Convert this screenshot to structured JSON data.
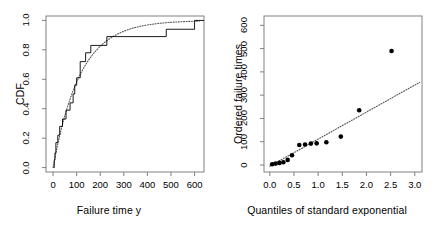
{
  "figure": {
    "background_color": "#ffffff",
    "foreground_color": "#000000",
    "panel_count": 2
  },
  "chart_data": [
    {
      "type": "line",
      "panel": "left",
      "title": "",
      "xlabel": "Failure time y",
      "ylabel": "CDF",
      "xlim": [
        -30,
        640
      ],
      "ylim": [
        -0.03,
        1.03
      ],
      "xticks": [
        0,
        100,
        200,
        300,
        400,
        500,
        600
      ],
      "xtick_labels": [
        "0",
        "100",
        "200",
        "300",
        "400",
        "500",
        "600"
      ],
      "yticks": [
        0.0,
        0.2,
        0.4,
        0.6,
        0.8,
        1.0
      ],
      "ytick_labels": [
        "0.0",
        "0.2",
        "0.4",
        "0.6",
        "0.8",
        "1.0"
      ],
      "grid": false,
      "legend": "none",
      "series": [
        {
          "name": "Empirical CDF",
          "style": "step",
          "line_style": "solid",
          "color": "#000000",
          "x": [
            2,
            5,
            8,
            12,
            20,
            28,
            40,
            55,
            72,
            85,
            92,
            100,
            115,
            138,
            160,
            228,
            480,
            600
          ],
          "y": [
            0.0,
            0.05,
            0.1,
            0.17,
            0.22,
            0.28,
            0.33,
            0.39,
            0.44,
            0.5,
            0.56,
            0.61,
            0.72,
            0.78,
            0.83,
            0.89,
            0.94,
            1.0
          ]
        },
        {
          "name": "Fitted exponential CDF",
          "style": "curve",
          "line_style": "dotted",
          "color": "#555555",
          "note": "F(y) = 1 - exp(-y/mean), mean approximately 115",
          "mean": 115,
          "x": [
            0,
            25,
            50,
            75,
            100,
            125,
            150,
            200,
            250,
            300,
            350,
            400,
            450,
            500,
            550,
            600
          ],
          "y": [
            0.0,
            0.196,
            0.352,
            0.478,
            0.58,
            0.662,
            0.729,
            0.825,
            0.886,
            0.927,
            0.953,
            0.97,
            0.98,
            0.987,
            0.992,
            0.995
          ]
        }
      ]
    },
    {
      "type": "scatter",
      "panel": "right",
      "title": "",
      "xlabel": "Quantiles of standard exponential",
      "ylabel": "Ordered failure times",
      "xlim": [
        -0.12,
        3.15
      ],
      "ylim": [
        -30,
        640
      ],
      "xticks": [
        0.0,
        0.5,
        1.0,
        1.5,
        2.0,
        2.5,
        3.0
      ],
      "xtick_labels": [
        "0.0",
        "0.5",
        "1.0",
        "1.5",
        "2.0",
        "2.5",
        "3.0"
      ],
      "yticks": [
        0,
        100,
        200,
        300,
        400,
        500,
        600
      ],
      "ytick_labels": [
        "0",
        "100",
        "200",
        "300",
        "400",
        "500",
        "600"
      ],
      "grid": false,
      "legend": "none",
      "series": [
        {
          "name": "Ordered failure times vs exponential quantiles",
          "style": "points",
          "marker": "filled-circle",
          "color": "#000000",
          "points": [
            {
              "x": 0.05,
              "y": 3
            },
            {
              "x": 0.12,
              "y": 6
            },
            {
              "x": 0.2,
              "y": 9
            },
            {
              "x": 0.28,
              "y": 12
            },
            {
              "x": 0.37,
              "y": 22
            },
            {
              "x": 0.46,
              "y": 42
            },
            {
              "x": 0.61,
              "y": 86
            },
            {
              "x": 0.73,
              "y": 88
            },
            {
              "x": 0.85,
              "y": 92
            },
            {
              "x": 0.97,
              "y": 93
            },
            {
              "x": 1.17,
              "y": 98
            },
            {
              "x": 1.47,
              "y": 122
            },
            {
              "x": 1.85,
              "y": 235
            },
            {
              "x": 2.52,
              "y": 490
            }
          ]
        },
        {
          "name": "Reference line",
          "style": "line",
          "line_style": "dotted",
          "color": "#555555",
          "x": [
            0.0,
            3.1
          ],
          "y": [
            -5,
            355
          ]
        }
      ]
    }
  ]
}
